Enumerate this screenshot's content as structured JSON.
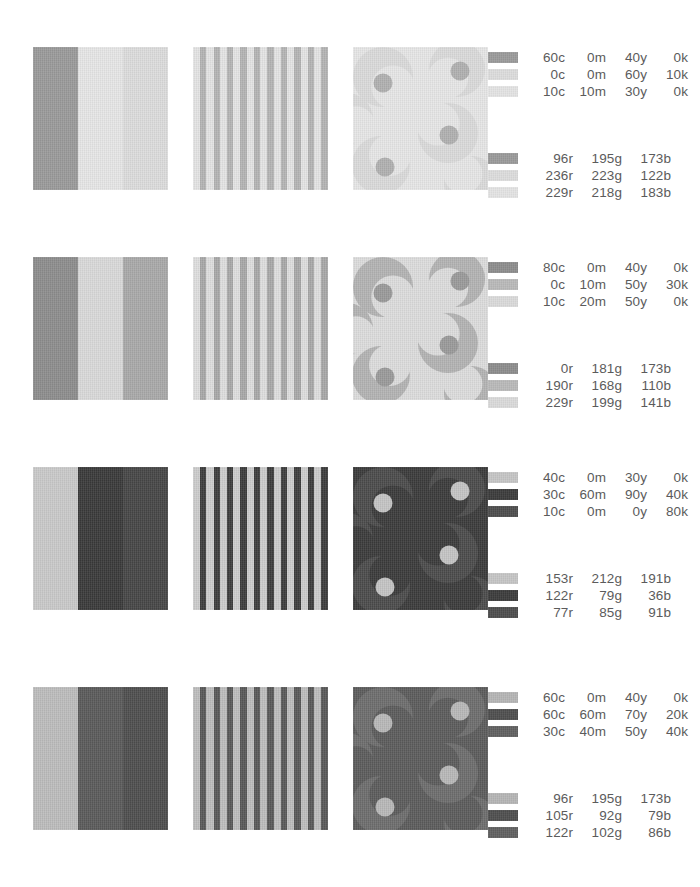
{
  "page": {
    "background": "#ffffff",
    "rows_count": 4
  },
  "columns": [
    {
      "name": "vertical-bands-block",
      "type": "bands"
    },
    {
      "name": "vertical-stripes-block",
      "type": "stripes"
    },
    {
      "name": "swirl-pattern-block",
      "type": "swirl"
    }
  ],
  "rows": [
    {
      "index": 1,
      "top": 47,
      "swatch_colors": [
        "#9a9a9a",
        "#dcdcdc",
        "#e3e3e3"
      ],
      "bands": [
        "#9a9a9a",
        "#e6e6e6",
        "#dcdcdc"
      ],
      "stripes": {
        "dark": "#b4b4b4",
        "light": "#e4e4e4",
        "count": 10
      },
      "swirl": {
        "bg": "#e6e6e6",
        "crescent": "#dadada",
        "dot": "#b0b0b0"
      },
      "cmyk": [
        {
          "c": "60c",
          "m": "0m",
          "y": "40y",
          "k": "0k"
        },
        {
          "c": "0c",
          "m": "0m",
          "y": "60y",
          "k": "10k"
        },
        {
          "c": "10c",
          "m": "10m",
          "y": "30y",
          "k": "0k"
        }
      ],
      "rgb": [
        {
          "r": "96r",
          "g": "195g",
          "b": "173b"
        },
        {
          "r": "236r",
          "g": "223g",
          "b": "122b"
        },
        {
          "r": "229r",
          "g": "218g",
          "b": "183b"
        }
      ]
    },
    {
      "index": 2,
      "top": 257,
      "swatch_colors": [
        "#8d8d8d",
        "#b9b9b9",
        "#dadada"
      ],
      "bands": [
        "#8d8d8d",
        "#d9d9d9",
        "#a9a9a9"
      ],
      "stripes": {
        "dark": "#a8a8a8",
        "light": "#dedede",
        "count": 10
      },
      "swirl": {
        "bg": "#dcdcdc",
        "crescent": "#b3b3b3",
        "dot": "#9a9a9a"
      },
      "cmyk": [
        {
          "c": "80c",
          "m": "0m",
          "y": "40y",
          "k": "0k"
        },
        {
          "c": "0c",
          "m": "10m",
          "y": "50y",
          "k": "30k"
        },
        {
          "c": "10c",
          "m": "20m",
          "y": "50y",
          "k": "0k"
        }
      ],
      "rgb": [
        {
          "r": "0r",
          "g": "181g",
          "b": "173b"
        },
        {
          "r": "190r",
          "g": "168g",
          "b": "110b"
        },
        {
          "r": "229r",
          "g": "199g",
          "b": "141b"
        }
      ]
    },
    {
      "index": 3,
      "top": 467,
      "swatch_colors": [
        "#c5c5c5",
        "#3c3c3c",
        "#4e4e4e"
      ],
      "bands": [
        "#c9c9c9",
        "#3a3a3a",
        "#464646"
      ],
      "stripes": {
        "dark": "#3c3c3c",
        "light": "#cccccc",
        "count": 10
      },
      "swirl": {
        "bg": "#3b3b3b",
        "crescent": "#4b4b4b",
        "dot": "#c4c4c4"
      },
      "cmyk": [
        {
          "c": "40c",
          "m": "0m",
          "y": "30y",
          "k": "0k"
        },
        {
          "c": "30c",
          "m": "60m",
          "y": "90y",
          "k": "40k"
        },
        {
          "c": "10c",
          "m": "0m",
          "y": "0y",
          "k": "80k"
        }
      ],
      "rgb": [
        {
          "r": "153r",
          "g": "212g",
          "b": "191b"
        },
        {
          "r": "122r",
          "g": "79g",
          "b": "36b"
        },
        {
          "r": "77r",
          "g": "85g",
          "b": "91b"
        }
      ]
    },
    {
      "index": 4,
      "top": 687,
      "swatch_colors": [
        "#b5b5b5",
        "#4f4f4f",
        "#616161"
      ],
      "bands": [
        "#bcbcbc",
        "#5a5a5a",
        "#4e4e4e"
      ],
      "stripes": {
        "dark": "#585858",
        "light": "#bdbdbd",
        "count": 10
      },
      "swirl": {
        "bg": "#5c5c5c",
        "crescent": "#6d6d6d",
        "dot": "#b8b8b8"
      },
      "cmyk": [
        {
          "c": "60c",
          "m": "0m",
          "y": "40y",
          "k": "0k"
        },
        {
          "c": "60c",
          "m": "60m",
          "y": "70y",
          "k": "20k"
        },
        {
          "c": "30c",
          "m": "40m",
          "y": "50y",
          "k": "40k"
        }
      ],
      "rgb": [
        {
          "r": "96r",
          "g": "195g",
          "b": "173b"
        },
        {
          "r": "105r",
          "g": "92g",
          "b": "79b"
        },
        {
          "r": "122r",
          "g": "102g",
          "b": "86b"
        }
      ]
    }
  ]
}
